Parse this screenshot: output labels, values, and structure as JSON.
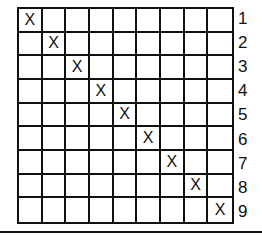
{
  "diagram": {
    "rows": 9,
    "cols": 9,
    "mark": "X",
    "marks": [
      [
        0,
        0
      ],
      [
        1,
        1
      ],
      [
        2,
        2
      ],
      [
        3,
        3
      ],
      [
        4,
        4
      ],
      [
        5,
        5
      ],
      [
        6,
        6
      ],
      [
        7,
        7
      ],
      [
        8,
        8
      ]
    ],
    "row_labels": [
      "1",
      "2",
      "3",
      "4",
      "5",
      "6",
      "7",
      "8",
      "9"
    ]
  }
}
